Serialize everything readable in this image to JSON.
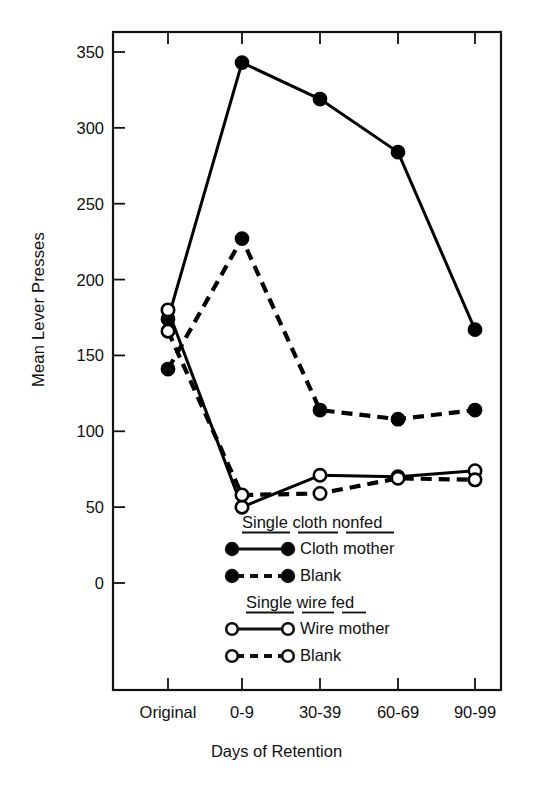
{
  "chart_data": {
    "type": "line",
    "title": "",
    "xlabel": "Days of Retention",
    "ylabel": "Mean Lever Presses",
    "categories": [
      "Original",
      "0-9",
      "30-39",
      "60-69",
      "90-99"
    ],
    "ylim": [
      -120,
      365
    ],
    "yticks": [
      0,
      50,
      100,
      150,
      200,
      250,
      300,
      350
    ],
    "ytick_labels": [
      "0",
      "50",
      "100",
      "150",
      "200",
      "250",
      "300",
      "350"
    ],
    "grid": false,
    "legend_position": "inside-center-bottom",
    "series": [
      {
        "name": "Cloth mother",
        "group": "Single cloth nonfed",
        "marker": "filled-circle",
        "line": "solid",
        "values": [
          174,
          343,
          319,
          284,
          167
        ]
      },
      {
        "name": "Blank",
        "group": "Single cloth nonfed",
        "marker": "filled-circle",
        "line": "dashed",
        "values": [
          141,
          227,
          114,
          108,
          114
        ]
      },
      {
        "name": "Wire mother",
        "group": "Single wire fed",
        "marker": "open-circle",
        "line": "solid",
        "values": [
          180,
          50,
          71,
          70,
          74
        ]
      },
      {
        "name": "Blank",
        "group": "Single wire fed",
        "marker": "open-circle",
        "line": "dashed",
        "values": [
          166,
          58,
          59,
          69,
          68
        ]
      }
    ],
    "legend": {
      "groups": [
        {
          "heading": "Single cloth nonfed",
          "entries": [
            {
              "label": "Cloth  mother",
              "marker": "filled-circle",
              "line": "solid"
            },
            {
              "label": "Blank",
              "marker": "filled-circle",
              "line": "dashed"
            }
          ]
        },
        {
          "heading": "Single wire fed",
          "entries": [
            {
              "label": "Wire mother",
              "marker": "open-circle",
              "line": "solid"
            },
            {
              "label": "Blank",
              "marker": "open-circle",
              "line": "dashed"
            }
          ]
        }
      ]
    },
    "colors": {
      "line": "#000000",
      "marker_fill": "#000000",
      "marker_open_fill": "#ffffff",
      "axis": "#111111",
      "background": "#ffffff"
    }
  }
}
